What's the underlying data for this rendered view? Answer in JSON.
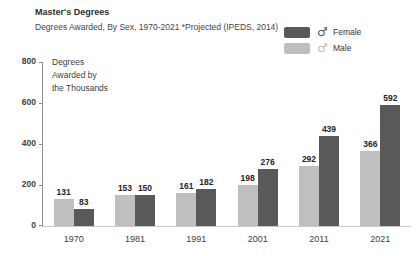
{
  "header": {
    "title": "Master's Degrees",
    "subtitle": "Degrees Awarded, By Sex, 1970-2021 *Projected (IPEDS, 2014)"
  },
  "legend": {
    "position": "top-right",
    "items": [
      {
        "label": "Female",
        "color": "#595959",
        "symbol": "♂",
        "symbol_name": "male-symbol-icon",
        "symbol_color": "#595959"
      },
      {
        "label": "Male",
        "color": "#bfbfbf",
        "symbol": "♂",
        "symbol_name": "male-symbol-icon",
        "symbol_color": "#c0c0c0"
      }
    ]
  },
  "chart_data": {
    "type": "bar",
    "title": "Master's Degrees",
    "subtitle": "Degrees Awarded, By Sex, 1970-2021 *Projected (IPEDS, 2014)",
    "categories": [
      "1970",
      "1981",
      "1991",
      "2001",
      "2011",
      "2021"
    ],
    "series": [
      {
        "name": "Male",
        "color": "#bfbfbf",
        "values": [
          131,
          153,
          161,
          198,
          292,
          366
        ]
      },
      {
        "name": "Female",
        "color": "#595959",
        "values": [
          83,
          150,
          182,
          276,
          439,
          592
        ]
      }
    ],
    "ylabel": "Degrees\nAwarded by\nthe Thousands",
    "xlabel": "",
    "ylim": [
      0,
      800
    ],
    "yticks": [
      0,
      200,
      400,
      600,
      800
    ],
    "grid": false,
    "data_labels": true,
    "legend_position": "top-right"
  },
  "colors": {
    "female_bar": "#595959",
    "male_bar": "#bfbfbf",
    "axis_line": "#8c8c8c",
    "baseline": "#c9c9c9",
    "text": "#404040"
  }
}
